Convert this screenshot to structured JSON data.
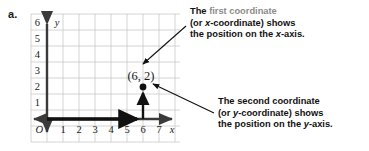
{
  "figure": {
    "part_label": "a.",
    "graph": {
      "origin_label": "O",
      "x_axis_label": "x",
      "y_axis_label": "y",
      "x_ticks": [
        "1",
        "2",
        "3",
        "4",
        "5",
        "6",
        "7"
      ],
      "y_ticks": [
        "1",
        "2",
        "3",
        "4",
        "5",
        "6"
      ],
      "point_label": "(6, 2)",
      "grid_color": "#c9c9c9",
      "axis_color": "#3a3a3a",
      "highlight_color": "#111111"
    },
    "callouts": [
      {
        "id": "x-coordinate-callout",
        "line1_lead": "The ",
        "line1_accent": "first coordinate",
        "line2": "(or x-coordinate) shows",
        "line3": "the position on the x-axis."
      },
      {
        "id": "y-coordinate-callout",
        "line1_lead": "The ",
        "line1_accent": "second coordinate",
        "line2": "(or y-coordinate) shows",
        "line3": "the position on the y-axis."
      }
    ]
  },
  "chart_data": {
    "type": "scatter",
    "title": "",
    "xlabel": "x",
    "ylabel": "y",
    "xlim": [
      0,
      7.6
    ],
    "ylim": [
      0,
      6.6
    ],
    "xticks": [
      1,
      2,
      3,
      4,
      5,
      6,
      7
    ],
    "yticks": [
      1,
      2,
      3,
      4,
      5,
      6
    ],
    "grid": true,
    "legend": "none",
    "points": [
      {
        "x": 6,
        "y": 2,
        "label": "(6, 2)"
      }
    ],
    "annotations": [
      {
        "type": "arrow",
        "name": "x-travel-arrow",
        "from": [
          0,
          0
        ],
        "to": [
          6,
          0
        ]
      },
      {
        "type": "arrow",
        "name": "y-travel-arrow",
        "from": [
          6,
          0
        ],
        "to": [
          6,
          2
        ]
      }
    ]
  }
}
